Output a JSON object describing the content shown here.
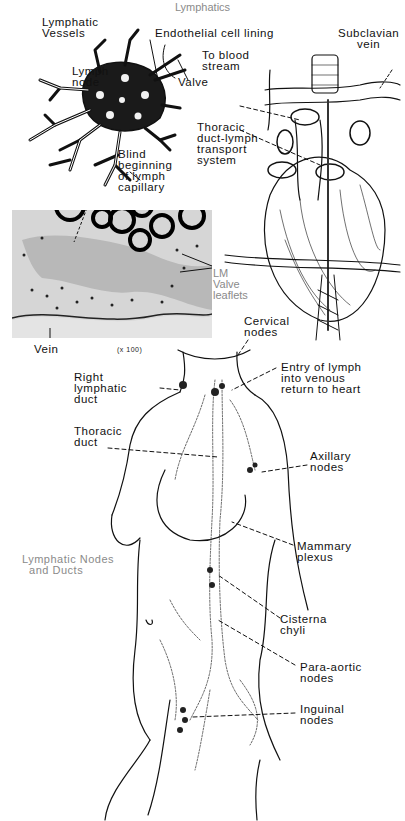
{
  "figure": {
    "title": "Lymphatics",
    "panels": {
      "lymph_node": {
        "labels": {
          "lymphatic_vessels": "Lymphatic\nVessels",
          "endothelial": "Endothelial cell lining",
          "to_blood": "To blood\nstream",
          "lymph_node": "Lymph\nnode",
          "valve": "Valve",
          "blind_beginning": "Blind\nbeginning\nof lymph\ncapillary"
        }
      },
      "heart": {
        "labels": {
          "subclavian": "Subclavian\nvein",
          "thoracic_transport": "Thoracic\nduct-lymph\ntransport\nsystem"
        }
      },
      "micrograph": {
        "labels": {
          "lm_valve": "LM\nValve\nleaflets",
          "vein": "Vein",
          "magnification": "(x 100)"
        }
      },
      "body": {
        "caption": "Lymphatic Nodes\n  and Ducts",
        "labels": {
          "cervical": "Cervical\nnodes",
          "right_lymphatic": "Right\nlymphatic\nduct",
          "entry": "Entry of lymph\ninto venous\nreturn to heart",
          "thoracic_duct": "Thoracic\nduct",
          "axillary": "Axillary\nnodes",
          "mammary": "Mammary\nplexus",
          "cisterna": "Cisterna\nchyli",
          "para_aortic": "Para-aortic\nnodes",
          "inguinal": "Inguinal\nnodes"
        }
      }
    },
    "colors": {
      "ink": "#111111",
      "caption_gray": "#8a8a8a",
      "micrograph_bg": "#d9d9d9",
      "lumen_gray": "#b8b8b8"
    }
  }
}
